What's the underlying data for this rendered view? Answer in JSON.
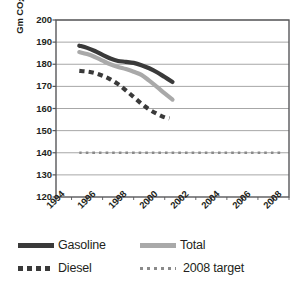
{
  "chart_data": {
    "type": "line",
    "title": "",
    "xlabel": "",
    "ylabel": "Gm CO2 per vehicle-km",
    "ylabel_prefix": "Gm CO",
    "ylabel_sub": "2",
    "ylabel_suffix": " per vehicle-km",
    "ylim": [
      120,
      200
    ],
    "ytick_step": 10,
    "yticks": [
      200,
      190,
      180,
      170,
      160,
      150,
      140,
      130,
      120
    ],
    "xlim": [
      1994,
      2009
    ],
    "xticks": [
      1994,
      1996,
      1998,
      2000,
      2002,
      2004,
      2006,
      2008
    ],
    "xminor_step": 1,
    "grid": "horizontal",
    "legend_position": "below",
    "series": [
      {
        "name": "Gasoline",
        "style": "solid",
        "color": "#3a3a3a",
        "width": 4.2,
        "x": [
          1995.5,
          1996.0,
          1996.5,
          1997.0,
          1997.5,
          1998.0,
          1998.5,
          1999.0,
          1999.5,
          2000.0,
          2000.5,
          2001.0,
          2001.5
        ],
        "y": [
          188.4,
          187.4,
          186.0,
          184.2,
          182.6,
          181.5,
          181.1,
          180.6,
          179.6,
          178.2,
          176.4,
          174.2,
          172.0
        ]
      },
      {
        "name": "Total",
        "style": "solid",
        "color": "#a9a9a9",
        "width": 4.2,
        "x": [
          1995.5,
          1996.0,
          1996.5,
          1997.0,
          1997.5,
          1998.0,
          1998.5,
          1999.0,
          1999.5,
          2000.0,
          2000.5,
          2001.0,
          2001.5
        ],
        "y": [
          185.5,
          184.6,
          183.3,
          181.6,
          180.0,
          178.8,
          177.8,
          176.6,
          175.2,
          172.6,
          169.8,
          166.8,
          164.0
        ]
      },
      {
        "name": "Diesel",
        "style": "dashed",
        "color": "#3a3a3a",
        "width": 4.2,
        "x": [
          1995.5,
          1996.0,
          1996.5,
          1997.0,
          1997.5,
          1998.0,
          1998.5,
          1999.0,
          1999.5,
          2000.0,
          2000.5,
          2001.0,
          2001.3
        ],
        "y": [
          177.0,
          176.7,
          176.0,
          174.8,
          173.2,
          171.0,
          168.2,
          165.2,
          162.2,
          159.6,
          157.6,
          156.0,
          155.5
        ]
      },
      {
        "name": "2008 target",
        "style": "dotted",
        "color": "#8a8a8a",
        "width": 2.6,
        "x": [
          1995.5,
          2008.6
        ],
        "y": [
          140,
          140
        ]
      }
    ]
  },
  "legend": {
    "items": [
      {
        "label": "Gasoline",
        "swatch": "solid-dark"
      },
      {
        "label": "Total",
        "swatch": "solid-gray"
      },
      {
        "label": "Diesel",
        "swatch": "dash-dark"
      },
      {
        "label": "2008 target",
        "swatch": "dot-gray"
      }
    ]
  },
  "colors": {
    "gasoline": "#3a3a3a",
    "total": "#a9a9a9",
    "diesel": "#3a3a3a",
    "target": "#8a8a8a",
    "axis": "#58585a",
    "grid": "#9d9d9d",
    "text": "#231f20"
  }
}
